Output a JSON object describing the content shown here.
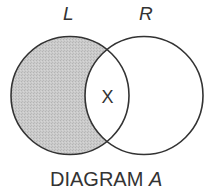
{
  "diagram": {
    "caption_main": "DIAGRAM ",
    "caption_italic": "A",
    "sets": [
      {
        "label": "L",
        "shaded": true
      },
      {
        "label": "R",
        "shaded": false
      }
    ],
    "intersection_mark": "X",
    "colors": {
      "shade": "#c6c6c6",
      "stroke": "#333333",
      "background": "#ffffff"
    }
  }
}
